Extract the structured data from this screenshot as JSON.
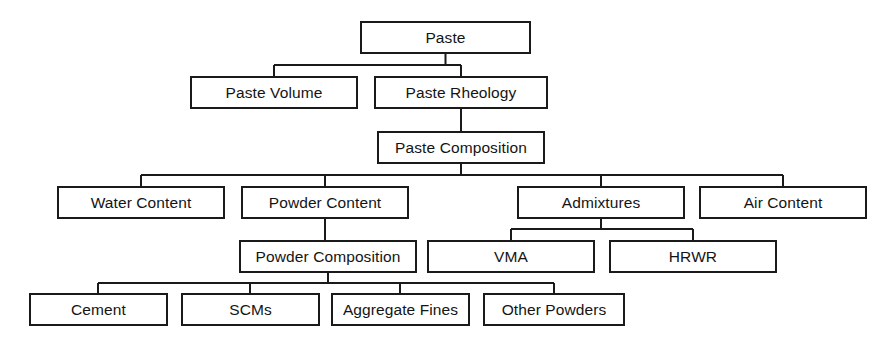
{
  "diagram": {
    "type": "tree-hierarchy",
    "style": {
      "box_fill": "#ffffff",
      "box_stroke": "#1a1a1a",
      "text_color": "#141414",
      "background": "#ffffff"
    },
    "nodes": [
      {
        "id": "paste",
        "label": "Paste",
        "x": 361,
        "y": 22,
        "w": 169,
        "h": 31,
        "level": 0
      },
      {
        "id": "paste-volume",
        "label": "Paste Volume",
        "x": 191,
        "y": 77,
        "w": 166,
        "h": 31,
        "level": 1
      },
      {
        "id": "paste-rheology",
        "label": "Paste Rheology",
        "x": 375,
        "y": 77,
        "w": 172,
        "h": 31,
        "level": 1
      },
      {
        "id": "paste-composition",
        "label": "Paste Composition",
        "x": 378,
        "y": 132,
        "w": 166,
        "h": 31,
        "level": 2
      },
      {
        "id": "water-content",
        "label": "Water Content",
        "x": 58,
        "y": 187,
        "w": 166,
        "h": 31,
        "level": 3
      },
      {
        "id": "powder-content",
        "label": "Powder Content",
        "x": 242,
        "y": 187,
        "w": 166,
        "h": 31,
        "level": 3
      },
      {
        "id": "admixtures",
        "label": "Admixtures",
        "x": 518,
        "y": 187,
        "w": 166,
        "h": 31,
        "level": 3
      },
      {
        "id": "air-content",
        "label": "Air Content",
        "x": 700,
        "y": 187,
        "w": 166,
        "h": 31,
        "level": 3
      },
      {
        "id": "powder-composition",
        "label": "Powder Composition",
        "x": 240,
        "y": 241,
        "w": 176,
        "h": 31,
        "level": 4
      },
      {
        "id": "vma",
        "label": "VMA",
        "x": 428,
        "y": 241,
        "w": 166,
        "h": 31,
        "level": 4
      },
      {
        "id": "hrwr",
        "label": "HRWR",
        "x": 610,
        "y": 241,
        "w": 166,
        "h": 31,
        "level": 4
      },
      {
        "id": "cement",
        "label": "Cement",
        "x": 30,
        "y": 294,
        "w": 137,
        "h": 31,
        "level": 5
      },
      {
        "id": "scms",
        "label": "SCMs",
        "x": 182,
        "y": 294,
        "w": 137,
        "h": 31,
        "level": 5
      },
      {
        "id": "aggregate-fines",
        "label": "Aggregate Fines",
        "x": 332,
        "y": 294,
        "w": 137,
        "h": 31,
        "level": 5
      },
      {
        "id": "other-powders",
        "label": "Other Powders",
        "x": 484,
        "y": 294,
        "w": 140,
        "h": 31,
        "level": 5
      }
    ],
    "connectors": [
      {
        "id": "paste-to-children",
        "from": "paste",
        "to": [
          "paste-volume",
          "paste-rheology"
        ],
        "path": "M445.5,53 L445.5,65 M274,65 L461,65 M274,65 L274,77 M461,65 L461,77"
      },
      {
        "id": "rheology-to-composition",
        "from": "paste-rheology",
        "to": [
          "paste-composition"
        ],
        "path": "M461,108 L461,132"
      },
      {
        "id": "composition-to-children",
        "from": "paste-composition",
        "to": [
          "water-content",
          "powder-content",
          "admixtures",
          "air-content"
        ],
        "path": "M461,163 L461,175 M141,175 L783,175 M141,175 L141,187 M325,175 L325,187 M601,175 L601,187 M783,175 L783,187"
      },
      {
        "id": "powder-content-to-composition",
        "from": "powder-content",
        "to": [
          "powder-composition"
        ],
        "path": "M325,218 L325,241"
      },
      {
        "id": "admixtures-to-children",
        "from": "admixtures",
        "to": [
          "vma",
          "hrwr"
        ],
        "path": "M601,218 L601,229 M511,229 L693,229 M511,229 L511,241 M693,229 L693,241"
      },
      {
        "id": "powder-composition-to-children",
        "from": "powder-composition",
        "to": [
          "cement",
          "scms",
          "aggregate-fines",
          "other-powders"
        ],
        "path": "M328,272 L328,283 M98,283 L554,283 M98,283 L98,294 M250,283 L250,294 M400,283 L400,294 M554,283 L554,294"
      }
    ]
  }
}
